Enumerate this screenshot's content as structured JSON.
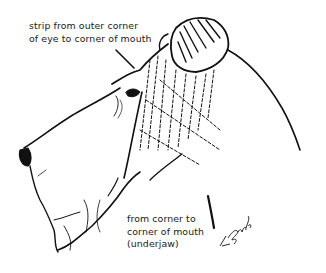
{
  "figure": {
    "annotations": [
      {
        "id": "eye-to-mouth",
        "lines": [
          "strip from outer corner",
          "of eye to corner of mouth"
        ]
      },
      {
        "id": "underjaw",
        "lines": [
          "from corner to",
          "corner of mouth",
          "(underjaw)"
        ]
      }
    ],
    "signature": "L.Byrd",
    "colors": {
      "ink": "#111111",
      "background": "#ffffff"
    }
  }
}
